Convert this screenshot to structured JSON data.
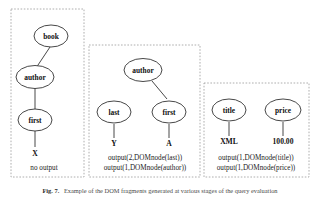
{
  "figure": {
    "caption_prefix": "Fig. 7.",
    "caption_text": "Example of the DOM fragments generated at various stages of the query evaluation"
  },
  "panels": [
    {
      "id": "panel-1",
      "nodes": [
        {
          "id": "book",
          "label": "book"
        },
        {
          "id": "author",
          "label": "author"
        },
        {
          "id": "first",
          "label": "first"
        }
      ],
      "leaves": [
        {
          "id": "x-value",
          "label": "X"
        }
      ],
      "note": "no output",
      "outputs": []
    },
    {
      "id": "panel-2",
      "nodes": [
        {
          "id": "author",
          "label": "author"
        },
        {
          "id": "last",
          "label": "last"
        },
        {
          "id": "first",
          "label": "first"
        }
      ],
      "leaves": [
        {
          "id": "y-value",
          "label": "Y"
        },
        {
          "id": "a-value",
          "label": "A"
        }
      ],
      "note": "",
      "outputs": [
        "output(2,DOMnode(last))",
        "output(1,DOMnode(author))"
      ]
    },
    {
      "id": "panel-3",
      "nodes": [
        {
          "id": "title",
          "label": "title"
        },
        {
          "id": "price",
          "label": "price"
        }
      ],
      "leaves": [
        {
          "id": "xml-value",
          "label": "XML"
        },
        {
          "id": "price-value",
          "label": "100.00"
        }
      ],
      "note": "",
      "outputs": [
        "output(1,DOMnode(title))",
        "output(1,DOMnode(price))"
      ]
    }
  ],
  "colors": {
    "panel_border": "#9a9a9a",
    "node_stroke": "#333333",
    "edge": "#333333",
    "background": "#ffffff"
  }
}
